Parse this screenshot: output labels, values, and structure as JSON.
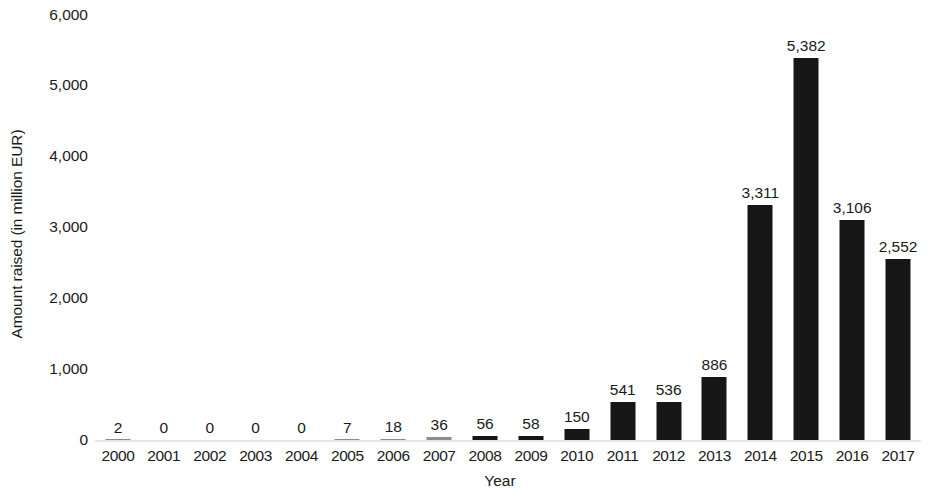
{
  "chart_data": {
    "type": "bar",
    "title": "",
    "xlabel": "Year",
    "ylabel": "Amount raised (in million EUR)",
    "categories": [
      "2000",
      "2001",
      "2002",
      "2003",
      "2004",
      "2005",
      "2006",
      "2007",
      "2008",
      "2009",
      "2010",
      "2011",
      "2012",
      "2013",
      "2014",
      "2015",
      "2016",
      "2017"
    ],
    "values": [
      2,
      0,
      0,
      0,
      0,
      7,
      18,
      36,
      56,
      58,
      150,
      541,
      536,
      886,
      3311,
      5382,
      3106,
      2552
    ],
    "value_labels": [
      "2",
      "0",
      "0",
      "0",
      "0",
      "7",
      "18",
      "36",
      "56",
      "58",
      "150",
      "541",
      "536",
      "886",
      "3,311",
      "5,382",
      "3,106",
      "2,552"
    ],
    "ylim": [
      0,
      6000
    ],
    "y_ticks": [
      0,
      1000,
      2000,
      3000,
      4000,
      5000,
      6000
    ],
    "y_tick_labels": [
      "0",
      "1,000",
      "2,000",
      "3,000",
      "4,000",
      "5,000",
      "6,000"
    ],
    "grid": true,
    "legend": false,
    "bar_color": "#161616",
    "tiny_bar_color": "#8c8c8c",
    "background_color": "#ffffff",
    "text_color": "#1a1a1a"
  }
}
